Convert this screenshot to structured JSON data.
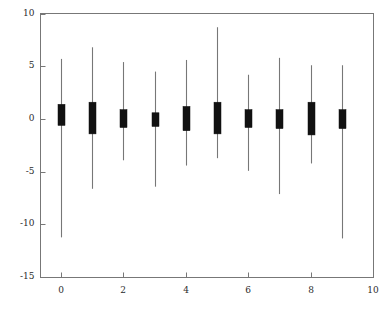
{
  "chart_data": {
    "type": "candlestick",
    "title": "",
    "xlabel": "",
    "ylabel": "",
    "xlim": [
      0,
      10
    ],
    "ylim": [
      -15,
      10
    ],
    "xticks": [
      0,
      2,
      4,
      6,
      8,
      10
    ],
    "xtick_labels": [
      "0",
      "2",
      "4",
      "6",
      "8",
      "10"
    ],
    "yticks": [
      10,
      5,
      0,
      -5,
      -10,
      -15
    ],
    "ytick_labels": [
      "10",
      "5",
      "0",
      "-5",
      "-10",
      "-15"
    ],
    "grid": false,
    "legend": null,
    "series_name": "candles",
    "body_color": "#111111",
    "wick_color": "#777777",
    "axis_color": "#777777",
    "background_color": "#ffffff",
    "x": [
      0,
      1,
      2,
      3,
      4,
      5,
      6,
      7,
      8,
      9
    ],
    "candles": [
      {
        "x": 0,
        "open": -0.6,
        "close": 1.4,
        "high": 5.7,
        "low": -11.2
      },
      {
        "x": 1,
        "open": -1.4,
        "close": 1.6,
        "high": 6.8,
        "low": -6.6
      },
      {
        "x": 2,
        "open": -0.8,
        "close": 0.9,
        "high": 5.4,
        "low": -3.9
      },
      {
        "x": 3,
        "open": -0.7,
        "close": 0.6,
        "high": 4.5,
        "low": -6.4
      },
      {
        "x": 4,
        "open": -1.1,
        "close": 1.2,
        "high": 5.6,
        "low": -4.4
      },
      {
        "x": 5,
        "open": -1.4,
        "close": 1.6,
        "high": 8.7,
        "low": -3.7
      },
      {
        "x": 6,
        "open": -0.8,
        "close": 0.9,
        "high": 4.2,
        "low": -4.9
      },
      {
        "x": 7,
        "open": -0.9,
        "close": 0.9,
        "high": 5.8,
        "low": -7.1
      },
      {
        "x": 8,
        "open": -1.5,
        "close": 1.6,
        "high": 5.1,
        "low": -4.2
      },
      {
        "x": 9,
        "open": -0.9,
        "close": 0.9,
        "high": 5.1,
        "low": -11.3
      }
    ]
  },
  "axes": {
    "x_positions": [
      61,
      123,
      186,
      248,
      311,
      373
    ],
    "y_positions": [
      14,
      66,
      119,
      172,
      224,
      277
    ]
  }
}
